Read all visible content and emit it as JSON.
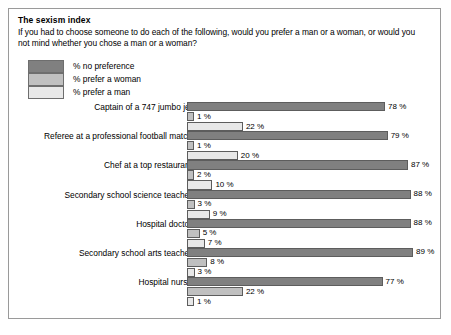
{
  "panel": {
    "title": "The sexism index",
    "question": "If you had to choose someone to do each of the following, would you prefer a man or a woman, or would you not mind whether you chose a man or a woman?"
  },
  "legend": {
    "items": [
      {
        "label": "% no preference",
        "color": "#808080"
      },
      {
        "label": "% prefer a woman",
        "color": "#c0c0c0"
      },
      {
        "label": "% prefer a man",
        "color": "#e8e8e8"
      }
    ]
  },
  "chart_data": {
    "type": "bar",
    "orientation": "horizontal",
    "title": "The sexism index",
    "subtitle": "If you had to choose someone to do each of the following, would you prefer a man or a woman, or would you not mind whether you chose a man or a woman?",
    "xlabel": "",
    "ylabel": "",
    "xlim": [
      0,
      100
    ],
    "grid": false,
    "legend_position": "top-left",
    "value_suffix": " %",
    "categories": [
      "Captain of a 747 jumbo jet",
      "Referee at a professional football match",
      "Chef at a top restaurant",
      "Secondary school science teacher",
      "Hospital doctor",
      "Secondary school arts teacher",
      "Hospital nurse"
    ],
    "series": [
      {
        "name": "% no preference",
        "color": "#808080",
        "values": [
          78,
          79,
          87,
          88,
          88,
          89,
          77
        ],
        "labels": [
          "78 %",
          "79 %",
          "87 %",
          "88 %",
          "88 %",
          "89 %",
          "77 %"
        ]
      },
      {
        "name": "% prefer a woman",
        "color": "#c0c0c0",
        "values": [
          1,
          1,
          2,
          3,
          5,
          8,
          22
        ],
        "labels": [
          "1 %",
          "1 %",
          "2 %",
          "3 %",
          "5 %",
          "8 %",
          "22 %"
        ]
      },
      {
        "name": "% prefer a man",
        "color": "#e8e8e8",
        "values": [
          22,
          20,
          10,
          9,
          7,
          3,
          1
        ],
        "labels": [
          "22 %",
          "20 %",
          "10 %",
          "9 %",
          "7 %",
          "3 %",
          "1 %"
        ]
      }
    ]
  }
}
